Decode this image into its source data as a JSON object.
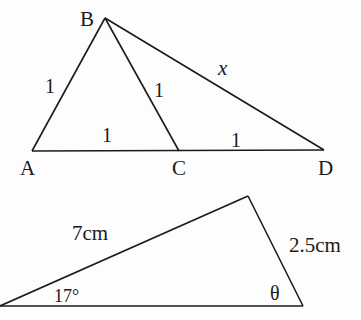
{
  "diagram1": {
    "vertices": {
      "A": "A",
      "B": "B",
      "C": "C",
      "D": "D"
    },
    "sides": {
      "AB": "1",
      "BC": "1",
      "AC": "1",
      "CD": "1",
      "BD": "x"
    }
  },
  "diagram2": {
    "sides": {
      "hypotenuse": "7cm",
      "right": "2.5cm"
    },
    "angles": {
      "left": "17°",
      "right": "θ"
    }
  },
  "colors": {
    "line": "#1a1a1a",
    "background": "#fdfdfd"
  }
}
